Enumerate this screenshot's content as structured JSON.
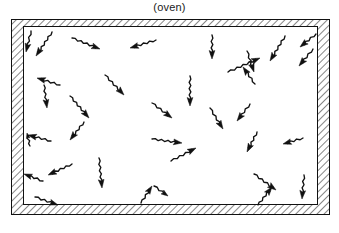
{
  "figure": {
    "caption": "(oven)",
    "colors": {
      "ink": "#111111",
      "hatch": "#222222",
      "background": "#ffffff",
      "interior": "#ffffff"
    },
    "enclosure": {
      "outer": {
        "x": 11,
        "y": 19,
        "width": 319,
        "height": 196
      },
      "inner": {
        "x": 23,
        "y": 26,
        "width": 295,
        "height": 179
      },
      "wall_hatch_angle_deg": 45,
      "wall_hatch_spacing": 5,
      "wall_thickness": {
        "top": 7,
        "bottom": 10,
        "left": 12,
        "right": 12
      }
    },
    "arrows": {
      "count": 35,
      "style": "wavy-shaft-with-solid-head",
      "items": [
        {
          "x1": 31,
          "y1": 31,
          "x2": 26,
          "y2": 52
        },
        {
          "x1": 52,
          "y1": 32,
          "x2": 36,
          "y2": 56
        },
        {
          "x1": 72,
          "y1": 38,
          "x2": 100,
          "y2": 49
        },
        {
          "x1": 156,
          "y1": 40,
          "x2": 130,
          "y2": 48
        },
        {
          "x1": 212,
          "y1": 35,
          "x2": 212,
          "y2": 59
        },
        {
          "x1": 285,
          "y1": 36,
          "x2": 270,
          "y2": 61
        },
        {
          "x1": 316,
          "y1": 34,
          "x2": 300,
          "y2": 47
        },
        {
          "x1": 313,
          "y1": 49,
          "x2": 299,
          "y2": 66
        },
        {
          "x1": 228,
          "y1": 72,
          "x2": 260,
          "y2": 58
        },
        {
          "x1": 255,
          "y1": 84,
          "x2": 243,
          "y2": 67
        },
        {
          "x1": 247,
          "y1": 51,
          "x2": 254,
          "y2": 72
        },
        {
          "x1": 60,
          "y1": 85,
          "x2": 37,
          "y2": 78
        },
        {
          "x1": 44,
          "y1": 85,
          "x2": 47,
          "y2": 108
        },
        {
          "x1": 105,
          "y1": 75,
          "x2": 124,
          "y2": 95
        },
        {
          "x1": 70,
          "y1": 96,
          "x2": 89,
          "y2": 118
        },
        {
          "x1": 190,
          "y1": 76,
          "x2": 190,
          "y2": 106
        },
        {
          "x1": 152,
          "y1": 103,
          "x2": 172,
          "y2": 118
        },
        {
          "x1": 210,
          "y1": 108,
          "x2": 223,
          "y2": 129
        },
        {
          "x1": 250,
          "y1": 104,
          "x2": 237,
          "y2": 121
        },
        {
          "x1": 30,
          "y1": 146,
          "x2": 27,
          "y2": 133
        },
        {
          "x1": 51,
          "y1": 141,
          "x2": 28,
          "y2": 135
        },
        {
          "x1": 84,
          "y1": 122,
          "x2": 70,
          "y2": 140
        },
        {
          "x1": 152,
          "y1": 139,
          "x2": 182,
          "y2": 143
        },
        {
          "x1": 171,
          "y1": 161,
          "x2": 196,
          "y2": 148
        },
        {
          "x1": 257,
          "y1": 132,
          "x2": 247,
          "y2": 152
        },
        {
          "x1": 303,
          "y1": 138,
          "x2": 283,
          "y2": 144
        },
        {
          "x1": 43,
          "y1": 181,
          "x2": 24,
          "y2": 174
        },
        {
          "x1": 72,
          "y1": 164,
          "x2": 48,
          "y2": 175
        },
        {
          "x1": 99,
          "y1": 158,
          "x2": 102,
          "y2": 188
        },
        {
          "x1": 141,
          "y1": 203,
          "x2": 152,
          "y2": 186
        },
        {
          "x1": 154,
          "y1": 186,
          "x2": 168,
          "y2": 196
        },
        {
          "x1": 35,
          "y1": 197,
          "x2": 58,
          "y2": 205
        },
        {
          "x1": 254,
          "y1": 174,
          "x2": 276,
          "y2": 190
        },
        {
          "x1": 258,
          "y1": 205,
          "x2": 272,
          "y2": 187
        },
        {
          "x1": 304,
          "y1": 175,
          "x2": 302,
          "y2": 199
        }
      ]
    }
  }
}
